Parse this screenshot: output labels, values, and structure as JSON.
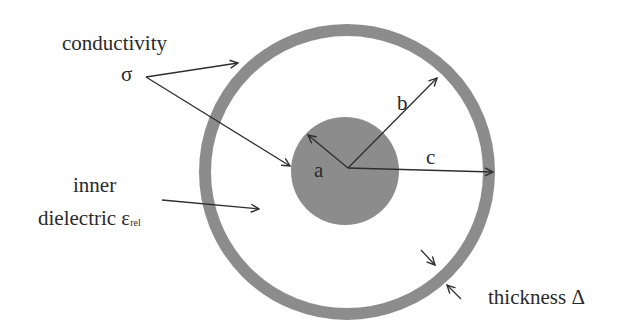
{
  "diagram": {
    "labels": {
      "conductivity": "conductivity",
      "sigma": "σ",
      "inner": "inner",
      "dielectric": "dielectric ε",
      "dielectric_sub": "rel",
      "radius_a": "a",
      "radius_b": "b",
      "radius_c": "c",
      "thickness": "thickness Δ"
    },
    "colors": {
      "fill": "#8c8c8c",
      "line": "#2e2e2e",
      "text": "#2a2a2a",
      "background": "#ffffff"
    },
    "geometry": {
      "center": [
        347,
        170
      ],
      "inner_radius_a": 54,
      "outer_ring_inner_radius_b": 136,
      "outer_ring_outer_radius_c": 148,
      "thickness_delta": 12
    }
  }
}
